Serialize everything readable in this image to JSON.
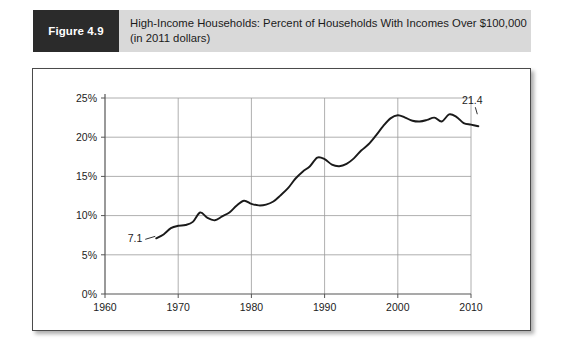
{
  "figure": {
    "number_label": "Figure 4.9",
    "title_line1": "High-Income Households: Percent of Households With Incomes Over $100,000",
    "title_line2": "(in 2011 dollars)",
    "badge_color": "#2b2b2b",
    "band_color": "#d9d9d9"
  },
  "chart_data": {
    "type": "line",
    "title": "High-Income Households: Percent of Households With Incomes Over $100,000 (in 2011 dollars)",
    "xlabel": "",
    "ylabel": "",
    "xlim": [
      1960,
      2010
    ],
    "ylim": [
      0,
      25
    ],
    "x_ticks": [
      "1960",
      "1970",
      "1980",
      "1990",
      "2000",
      "2010"
    ],
    "x_tick_values": [
      1960,
      1970,
      1980,
      1990,
      2000,
      2010
    ],
    "y_ticks": [
      "0%",
      "5%",
      "10%",
      "15%",
      "20%",
      "25%"
    ],
    "y_tick_values": [
      0,
      5,
      10,
      15,
      20,
      25
    ],
    "grid": true,
    "legend": "none",
    "line_color": "#1a1a1a",
    "series": [
      {
        "name": "Percent of households with incomes over $100,000",
        "x": [
          1967,
          1968,
          1969,
          1970,
          1971,
          1972,
          1973,
          1974,
          1975,
          1976,
          1977,
          1978,
          1979,
          1980,
          1981,
          1982,
          1983,
          1984,
          1985,
          1986,
          1987,
          1988,
          1989,
          1990,
          1991,
          1992,
          1993,
          1994,
          1995,
          1996,
          1997,
          1998,
          1999,
          2000,
          2001,
          2002,
          2003,
          2004,
          2005,
          2006,
          2007,
          2008,
          2009,
          2010,
          2011
        ],
        "values": [
          7.1,
          7.6,
          8.4,
          8.7,
          8.8,
          9.2,
          10.4,
          9.7,
          9.4,
          9.9,
          10.4,
          11.3,
          11.9,
          11.5,
          11.3,
          11.4,
          11.8,
          12.6,
          13.5,
          14.7,
          15.6,
          16.3,
          17.4,
          17.2,
          16.5,
          16.3,
          16.6,
          17.3,
          18.3,
          19.1,
          20.2,
          21.4,
          22.4,
          22.8,
          22.5,
          22.1,
          22.0,
          22.2,
          22.5,
          22.0,
          22.9,
          22.6,
          21.8,
          21.6,
          21.4
        ]
      }
    ],
    "annotations": [
      {
        "label": "7.1",
        "x": 1967,
        "y": 7.1,
        "position": "left"
      },
      {
        "label": "21.4",
        "x": 2011,
        "y": 21.4,
        "position": "above-left"
      }
    ]
  }
}
